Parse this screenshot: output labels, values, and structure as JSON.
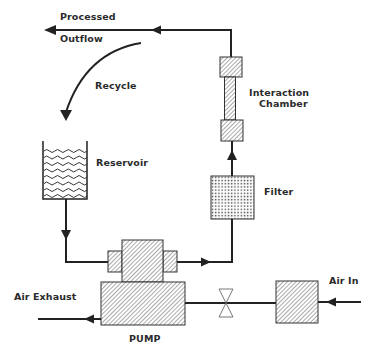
{
  "diagram": {
    "type": "process-flow",
    "colors": {
      "line": "#222222",
      "hatch": "#555555",
      "fill": "#ffffff",
      "text": "#2a2a2a"
    },
    "labels": {
      "processed": "Processed",
      "outflow": "Outflow",
      "recycle": "Recycle",
      "interaction_line1": "Interaction",
      "interaction_line2": "Chamber",
      "reservoir": "Reservoir",
      "filter": "Filter",
      "air_in": "Air In",
      "air_exhaust": "Air Exhaust",
      "pump": "PUMP"
    },
    "components": [
      {
        "id": "reservoir",
        "label": "Reservoir",
        "pattern": "waves"
      },
      {
        "id": "pump",
        "label": "PUMP",
        "pattern": "hatch"
      },
      {
        "id": "filter",
        "label": "Filter",
        "pattern": "dots"
      },
      {
        "id": "interaction-chamber",
        "label": "Interaction Chamber",
        "pattern": "hatch"
      },
      {
        "id": "air-valve",
        "label": "",
        "pattern": "bowtie"
      },
      {
        "id": "air-inlet-box",
        "label": "",
        "pattern": "hatch"
      }
    ],
    "flows": [
      {
        "from": "reservoir",
        "to": "pump"
      },
      {
        "from": "pump",
        "to": "filter"
      },
      {
        "from": "filter",
        "to": "interaction-chamber"
      },
      {
        "from": "interaction-chamber",
        "to": "processed-outflow"
      },
      {
        "from": "processed-outflow",
        "to": "reservoir",
        "label": "Recycle"
      },
      {
        "from": "air-in",
        "to": "air-inlet-box"
      },
      {
        "from": "air-inlet-box",
        "to": "pump",
        "via": "air-valve"
      },
      {
        "from": "pump",
        "to": "air-exhaust"
      }
    ]
  }
}
